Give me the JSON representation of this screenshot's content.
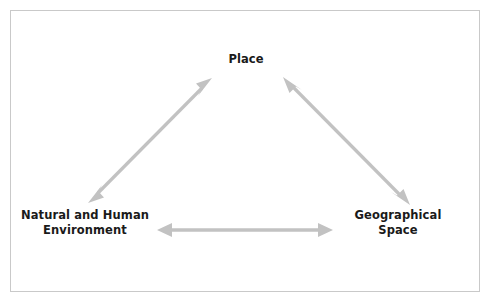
{
  "diagram": {
    "title_visible": false,
    "background_color": "#ffffff",
    "border_color": "#c9c9c9",
    "arrow_color": "#c2c2c2",
    "text_color": "#1a1a1a",
    "nodes": [
      {
        "id": "place",
        "label": "Place",
        "position": "top-center",
        "x": 246,
        "y": 60
      },
      {
        "id": "environment",
        "label": "Natural and Human\nEnvironment",
        "line1": "Natural and Human",
        "line2": "Environment",
        "position": "bottom-left",
        "x": 85,
        "y": 224
      },
      {
        "id": "space",
        "label": "Geographical\nSpace",
        "line1": "Geographical",
        "line2": "Space",
        "position": "bottom-right",
        "x": 398,
        "y": 224
      }
    ],
    "connectors": [
      {
        "id": "environment-place",
        "from": "environment",
        "to": "place",
        "style": "double-headed-arrow",
        "color": "#c2c2c2",
        "x1": 88,
        "y1": 203,
        "x2": 212,
        "y2": 78
      },
      {
        "id": "place-space",
        "from": "place",
        "to": "space",
        "style": "double-headed-arrow",
        "color": "#c2c2c2",
        "x1": 283,
        "y1": 77,
        "x2": 410,
        "y2": 205
      },
      {
        "id": "environment-space",
        "from": "environment",
        "to": "space",
        "style": "double-headed-arrow",
        "color": "#c2c2c2",
        "x1": 157,
        "y1": 230,
        "x2": 333,
        "y2": 230
      }
    ]
  }
}
